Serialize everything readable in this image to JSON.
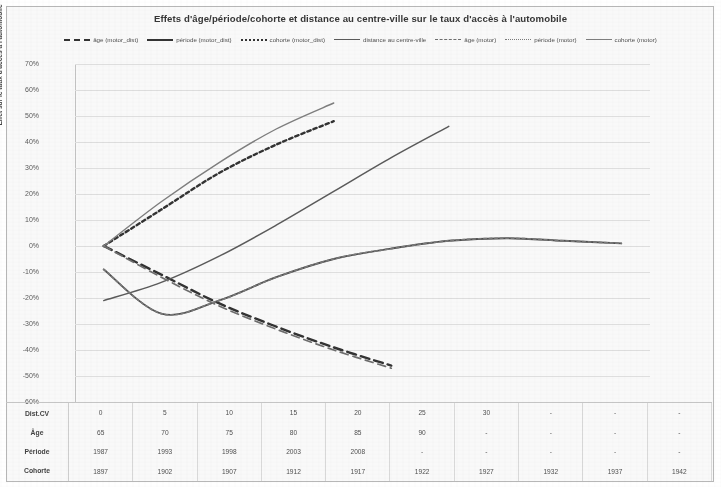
{
  "chart_data": {
    "type": "line",
    "title": "Effets d'âge/période/cohorte et distance au centre-ville sur  le taux d'accès à l'automobile",
    "xlabel": "",
    "ylabel": "Effet sur le taux d'accès à l'automobile",
    "ylim": [
      -60,
      70
    ],
    "ytick_labels": [
      "70%",
      "60%",
      "50%",
      "40%",
      "30%",
      "20%",
      "10%",
      "0%",
      "-10%",
      "-20%",
      "-30%",
      "-40%",
      "-50%",
      "-60%"
    ],
    "ytick_values": [
      70,
      60,
      50,
      40,
      30,
      20,
      10,
      0,
      -10,
      -20,
      -30,
      -40,
      -50,
      -60
    ],
    "grid": true,
    "legend_position": "top",
    "x_index": [
      0,
      1,
      2,
      3,
      4,
      5,
      6,
      7,
      8,
      9
    ],
    "series": [
      {
        "name": "âge (motor_dist)",
        "style": "dashed-bold",
        "color": "#2b2b2b",
        "x": [
          0,
          1,
          2,
          3,
          4,
          5
        ],
        "values": [
          0,
          -11,
          -22,
          -31,
          -39,
          -46
        ]
      },
      {
        "name": "période (motor_dist)",
        "style": "solid-bold",
        "color": "#4a4a4a",
        "x": [
          0,
          1,
          2,
          3,
          4,
          5,
          6,
          7,
          8,
          9
        ],
        "values": [
          -9,
          -26,
          -21,
          -12,
          -5,
          -1,
          2,
          3,
          2,
          1
        ]
      },
      {
        "name": "cohorte (motor_dist)",
        "style": "dotted-bold",
        "color": "#2b2b2b",
        "x": [
          0,
          1,
          2,
          3,
          4
        ],
        "values": [
          0,
          14,
          28,
          39,
          48
        ]
      },
      {
        "name": "distance au centre-ville",
        "style": "solid",
        "color": "#555555",
        "x": [
          0,
          1,
          2,
          3,
          4,
          5,
          6
        ],
        "values": [
          -21,
          -14,
          -4,
          8,
          21,
          34,
          46
        ]
      },
      {
        "name": "âge (motor)",
        "style": "dashed-thin",
        "color": "#6a6a6a",
        "x": [
          0,
          1,
          2,
          3,
          4,
          5
        ],
        "values": [
          0,
          -12,
          -23,
          -32,
          -40,
          -47
        ]
      },
      {
        "name": "période (motor)",
        "style": "dotted-thin",
        "color": "#777777",
        "x": [
          0,
          1,
          2,
          3,
          4,
          5,
          6,
          7,
          8,
          9
        ],
        "values": [
          -9,
          -26,
          -21,
          -12,
          -5,
          -1,
          2,
          3,
          2,
          1
        ]
      },
      {
        "name": "cohorte (motor)",
        "style": "solid-light",
        "color": "#7b7b7b",
        "x": [
          0,
          1,
          2,
          3,
          4
        ],
        "values": [
          0,
          17,
          32,
          45,
          55
        ]
      }
    ],
    "table": {
      "row_labels": [
        "Dist.CV",
        "Âge",
        "Période",
        "Cohorte"
      ],
      "rows": [
        [
          "0",
          "5",
          "10",
          "15",
          "20",
          "25",
          "30",
          "-",
          "-",
          "-"
        ],
        [
          "65",
          "70",
          "75",
          "80",
          "85",
          "90",
          "-",
          "-",
          "-",
          "-"
        ],
        [
          "1987",
          "1993",
          "1998",
          "2003",
          "2008",
          "-",
          "-",
          "-",
          "-",
          "-"
        ],
        [
          "1897",
          "1902",
          "1907",
          "1912",
          "1917",
          "1922",
          "1927",
          "1932",
          "1937",
          "1942"
        ]
      ]
    }
  }
}
